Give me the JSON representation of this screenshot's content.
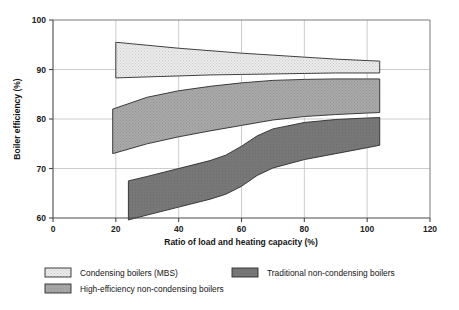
{
  "chart_data": {
    "type": "area",
    "title": "",
    "xlabel": "Ratio of load and heating capacity (%)",
    "ylabel": "Boiler efficiency (%)",
    "xlim": [
      0,
      120
    ],
    "ylim": [
      60,
      100
    ],
    "xticks": [
      0,
      20,
      40,
      60,
      80,
      100,
      120
    ],
    "yticks": [
      60,
      70,
      80,
      90,
      100
    ],
    "grid": true,
    "legend_position": "bottom",
    "series": [
      {
        "name": "Condensing boilers (MBS)",
        "color": "#e0e0e0",
        "pattern": "fine-dots",
        "x": [
          20,
          30,
          40,
          50,
          60,
          70,
          80,
          90,
          100,
          104
        ],
        "upper": [
          95.5,
          94.9,
          94.3,
          93.8,
          93.3,
          92.9,
          92.5,
          92.1,
          91.8,
          91.7
        ],
        "lower": [
          88.3,
          88.5,
          88.7,
          88.9,
          89.0,
          89.1,
          89.2,
          89.3,
          89.3,
          89.3
        ]
      },
      {
        "name": "High-efficiency non-condensing boilers",
        "color": "#a8a8a8",
        "pattern": "medium-dots",
        "x": [
          19,
          30,
          40,
          50,
          60,
          70,
          80,
          90,
          100,
          104
        ],
        "upper": [
          82.0,
          84.4,
          85.7,
          86.6,
          87.3,
          87.8,
          88.0,
          88.1,
          88.1,
          88.1
        ],
        "lower": [
          73.0,
          75.0,
          76.4,
          77.6,
          78.7,
          79.8,
          80.5,
          80.9,
          81.2,
          81.3
        ]
      },
      {
        "name": "Traditional non-condensing boilers",
        "color": "#767676",
        "pattern": "solid",
        "x": [
          24,
          30,
          40,
          50,
          55,
          60,
          65,
          70,
          80,
          90,
          100,
          104
        ],
        "upper": [
          67.5,
          68.4,
          70.0,
          71.6,
          72.7,
          74.5,
          76.6,
          78.0,
          79.3,
          79.9,
          80.2,
          80.3
        ],
        "lower": [
          59.6,
          60.6,
          62.2,
          63.8,
          64.8,
          66.4,
          68.6,
          70.1,
          71.8,
          73.0,
          74.2,
          74.7
        ]
      }
    ]
  },
  "axes": {
    "x_tick_labels": [
      "0",
      "20",
      "40",
      "60",
      "80",
      "100",
      "120"
    ],
    "y_tick_labels": [
      "60",
      "70",
      "80",
      "90",
      "100"
    ],
    "x_title": "Ratio of load and heating capacity (%)",
    "y_title": "Boiler efficiency (%)"
  },
  "legend": {
    "items": [
      {
        "label": "Condensing boilers (MBS)",
        "color": "#e0e0e0",
        "column": 0,
        "row": 0
      },
      {
        "label": "Traditional non-condensing boilers",
        "color": "#767676",
        "column": 1,
        "row": 0
      },
      {
        "label": "High-efficiency non-condensing boilers",
        "color": "#a8a8a8",
        "column": 0,
        "row": 1
      }
    ]
  }
}
